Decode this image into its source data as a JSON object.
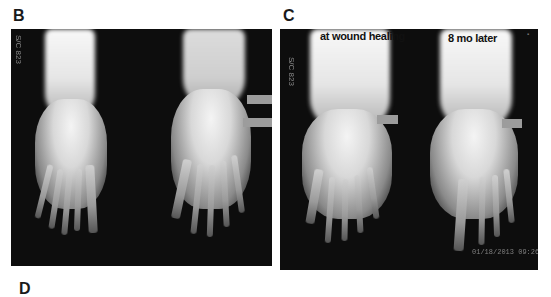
{
  "figure": {
    "panels": [
      {
        "id": "B",
        "label": "B",
        "images": [
          {
            "name": "foot-xray-left",
            "caption": ""
          },
          {
            "name": "foot-xray-right",
            "caption": ""
          }
        ],
        "side_text": "S/C 823",
        "arrows": 2
      },
      {
        "id": "C",
        "label": "C",
        "images": [
          {
            "name": "foot-xray-at-wound-healing",
            "caption": "at wound healing"
          },
          {
            "name": "foot-xray-8-mo-later",
            "caption": "8 mo later"
          }
        ],
        "side_text": "S/C 823",
        "date_stamp": "01/18/2013 09:26",
        "arrows": 2
      }
    ],
    "next_panel_label": "D"
  },
  "colors": {
    "background": "#ffffff",
    "panel_bg": "#0d0d0d",
    "arrow": "#9c9c9c",
    "label": "#1a1a1a"
  }
}
